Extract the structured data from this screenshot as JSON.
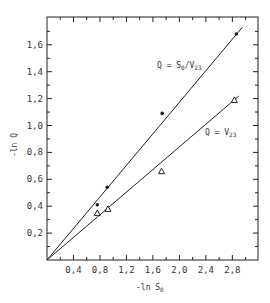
{
  "chart_data": {
    "type": "scatter",
    "title": "",
    "xlabel": "-ln S0",
    "ylabel": "-ln Q",
    "xlim": [
      0,
      3.05
    ],
    "ylim": [
      0,
      1.8
    ],
    "x_ticks": [
      "0.4",
      "0.8",
      "1.2",
      "1.6",
      "2.0",
      "2.4",
      "2.8"
    ],
    "y_ticks": [
      "0.2",
      "0.4",
      "0.6",
      "0.8",
      "1.0",
      "1.2",
      "1.4",
      "1.6"
    ],
    "grid": false,
    "legend": "none (inline line annotations)",
    "series": [
      {
        "name": "Q = S0/V23",
        "marker": "filled-circle",
        "points": [
          [
            0.76,
            0.41
          ],
          [
            0.91,
            0.54
          ],
          [
            1.74,
            1.09
          ],
          [
            2.86,
            1.68
          ]
        ],
        "fit_line": {
          "from": [
            0,
            0
          ],
          "to": [
            2.95,
            1.73
          ]
        }
      },
      {
        "name": "Q = V23",
        "marker": "open-triangle",
        "points": [
          [
            0.76,
            0.35
          ],
          [
            0.92,
            0.38
          ],
          [
            1.73,
            0.66
          ],
          [
            2.83,
            1.19
          ]
        ],
        "fit_line": {
          "from": [
            0,
            0
          ],
          "to": [
            2.9,
            1.22
          ]
        }
      }
    ],
    "annotations": [
      {
        "text": "Q = S0/V23",
        "near": [
          1.85,
          1.3
        ]
      },
      {
        "text": "Q = V23",
        "near": [
          2.1,
          0.8
        ]
      }
    ]
  },
  "labels": {
    "xlabel_main": "-ln S",
    "xlabel_sub": "0",
    "ylabel": "-ln Q",
    "annot1_main": "Q = S",
    "annot1_sub1": "0",
    "annot1_mid": "/V",
    "annot1_sub2": "23",
    "annot2_main": "Q = V",
    "annot2_sub": "23"
  }
}
